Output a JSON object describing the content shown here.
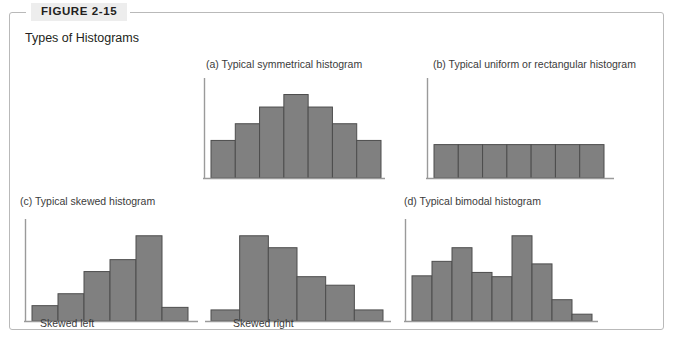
{
  "figure": {
    "label": "FIGURE 2-15",
    "title": "Types of Histograms",
    "frame_color": "#b9b9b9",
    "label_bg": "#ededed",
    "bar_fill": "#808080",
    "bar_stroke": "#4d4d4d",
    "axis_color": "#9a9a9a",
    "text_color": "#3b3b3b"
  },
  "panels": [
    {
      "id": "a",
      "caption": "(a)  Typical symmetrical histogram",
      "sublabel": "",
      "show_y_axis": true
    },
    {
      "id": "b",
      "caption": "(b)  Typical uniform or rectangular histogram",
      "sublabel": "",
      "show_y_axis": true
    },
    {
      "id": "c",
      "caption": "(c)  Typical skewed histogram",
      "sublabel": "Skewed left",
      "show_y_axis": true
    },
    {
      "id": "c2",
      "caption": "",
      "sublabel": "Skewed right",
      "show_y_axis": false
    },
    {
      "id": "d",
      "caption": "(d)  Typical bimodal histogram",
      "sublabel": "",
      "show_y_axis": true
    }
  ],
  "chart_data": [
    {
      "type": "bar",
      "id": "a",
      "title": "(a)  Typical symmetrical histogram",
      "xlabel": "",
      "ylabel": "",
      "grid": false,
      "legend": "none",
      "categories": [
        "1",
        "2",
        "3",
        "4",
        "5",
        "6",
        "7"
      ],
      "values": [
        45,
        65,
        85,
        100,
        85,
        65,
        45
      ],
      "ylim": [
        0,
        115
      ]
    },
    {
      "type": "bar",
      "id": "b",
      "title": "(b)  Typical uniform or rectangular histogram",
      "xlabel": "",
      "ylabel": "",
      "grid": false,
      "legend": "none",
      "categories": [
        "1",
        "2",
        "3",
        "4",
        "5",
        "6",
        "7"
      ],
      "values": [
        40,
        40,
        40,
        40,
        40,
        40,
        40
      ],
      "ylim": [
        0,
        115
      ]
    },
    {
      "type": "bar",
      "id": "c",
      "title": "(c)  Typical skewed histogram — Skewed left",
      "xlabel": "",
      "ylabel": "",
      "grid": false,
      "legend": "none",
      "categories": [
        "1",
        "2",
        "3",
        "4",
        "5",
        "6"
      ],
      "values": [
        18,
        32,
        58,
        72,
        100,
        16
      ],
      "ylim": [
        0,
        115
      ]
    },
    {
      "type": "bar",
      "id": "c2",
      "title": "Skewed right",
      "xlabel": "",
      "ylabel": "",
      "grid": false,
      "legend": "none",
      "categories": [
        "1",
        "2",
        "3",
        "4",
        "5",
        "6"
      ],
      "values": [
        13,
        100,
        86,
        52,
        42,
        13
      ],
      "ylim": [
        0,
        115
      ]
    },
    {
      "type": "bar",
      "id": "d",
      "title": "(d)  Typical bimodal histogram",
      "xlabel": "",
      "ylabel": "",
      "grid": false,
      "legend": "none",
      "categories": [
        "1",
        "2",
        "3",
        "4",
        "5",
        "6",
        "7",
        "8",
        "9"
      ],
      "values": [
        53,
        70,
        86,
        57,
        52,
        100,
        67,
        25,
        8
      ],
      "ylim": [
        0,
        115
      ]
    }
  ]
}
